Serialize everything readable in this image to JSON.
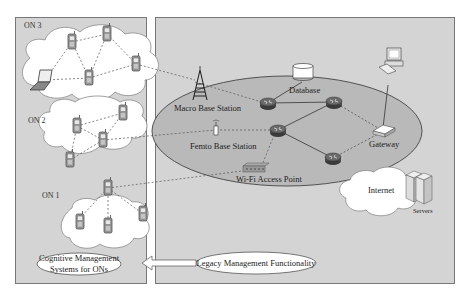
{
  "figure": {
    "left_panel": {
      "networks": [
        {
          "id": "on3",
          "label": "ON 3"
        },
        {
          "id": "on2",
          "label": "ON 2"
        },
        {
          "id": "on1",
          "label": "ON 1"
        }
      ],
      "management_box": {
        "line1": "Cognitive Management",
        "line2": "Systems for ONs"
      }
    },
    "right_panel": {
      "nodes": {
        "macro_bs": "Macro Base Station",
        "femto_bs": "Femto Base Station",
        "wifi_ap": "Wi-Fi Access Point",
        "database": "Database",
        "gateway": "Gateway",
        "internet": "Internet",
        "servers": "Servers"
      },
      "management_box": {
        "label": "Legacy Management Functionality"
      }
    },
    "colors": {
      "panel_fill": "#d4d4d4",
      "panel_border": "#777777",
      "oval_fill": "#b9b9b9",
      "cloud_fill": "#ffffff",
      "router_fill": "#555555"
    }
  }
}
